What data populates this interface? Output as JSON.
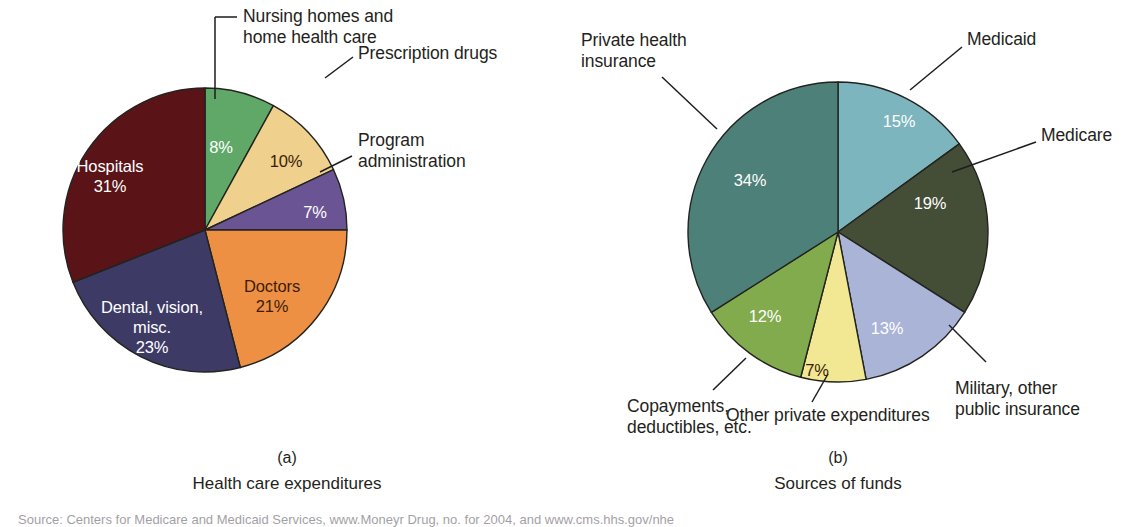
{
  "figure": {
    "background": "#ffffff",
    "source_note": "Source: Centers for Medicare and Medicaid Services, www.Moneyr Drug, no. for 2004, and www.cms.hhs.gov/nhe"
  },
  "chart_data": [
    {
      "type": "pie",
      "id": "health-care-expenditures",
      "panel_letter": "(a)",
      "title": "Health care expenditures",
      "start_angle_deg": 0,
      "direction": "clockwise",
      "center": [
        205,
        230
      ],
      "radius": 142,
      "categories": [
        "Nursing homes and home health care",
        "Prescription drugs",
        "Program administration",
        "Doctors",
        "Dental, vision, misc.",
        "Hospitals"
      ],
      "values": [
        8,
        10,
        7,
        21,
        23,
        31
      ],
      "value_labels": [
        "8%",
        "10%",
        "7%",
        "21%",
        "23%",
        "31%"
      ],
      "colors": [
        "#5FA868",
        "#EFD08C",
        "#6B5494",
        "#ED9043",
        "#3D3B66",
        "#5A1418"
      ],
      "slices": [
        {
          "name": "Nursing homes and home health care",
          "value": 8,
          "value_label": "8%",
          "color": "#5FA868",
          "inside_label": "8%",
          "label_color": "white",
          "label_xy": [
            221,
            147
          ],
          "callout": {
            "text": "Nursing homes and\nhome health care",
            "x": 243,
            "y": 6,
            "align": "left",
            "line": [
              [
                215,
                17
              ],
              [
                237,
                17
              ]
            ],
            "stem": [
              [
                215,
                17
              ],
              [
                215,
                99
              ]
            ]
          }
        },
        {
          "name": "Prescription drugs",
          "value": 10,
          "value_label": "10%",
          "color": "#EFD08C",
          "inside_label": "10%",
          "label_color": "dark",
          "label_xy": [
            286,
            161
          ],
          "callout": {
            "text": "Prescription drugs",
            "x": 358,
            "y": 43,
            "align": "left",
            "line": [
              [
                325,
                78
              ],
              [
                353,
                57
              ]
            ]
          }
        },
        {
          "name": "Program administration",
          "value": 7,
          "value_label": "7%",
          "color": "#6B5494",
          "inside_label": "7%",
          "label_color": "white",
          "label_xy": [
            315,
            212
          ],
          "callout": {
            "text": "Program\nadministration",
            "x": 358,
            "y": 130,
            "align": "left",
            "line": [
              [
                320,
                172
              ],
              [
                352,
                156
              ]
            ]
          }
        },
        {
          "name": "Doctors",
          "value": 21,
          "value_label": "21%",
          "color": "#ED9043",
          "inside_label": "Doctors\n21%",
          "label_color": "dark",
          "label_xy": [
            272,
            296
          ],
          "callout": null
        },
        {
          "name": "Dental, vision, misc.",
          "value": 23,
          "value_label": "23%",
          "color": "#3D3B66",
          "inside_label": "Dental, vision,\nmisc.\n23%",
          "label_color": "white",
          "label_xy": [
            152,
            327
          ],
          "callout": null
        },
        {
          "name": "Hospitals",
          "value": 31,
          "value_label": "31%",
          "color": "#5A1418",
          "inside_label": "Hospitals\n31%",
          "label_color": "white",
          "label_xy": [
            110,
            176
          ],
          "callout": null
        }
      ]
    },
    {
      "type": "pie",
      "id": "sources-of-funds",
      "panel_letter": "(b)",
      "title": "Sources of funds",
      "start_angle_deg": 0,
      "direction": "clockwise",
      "center": [
        838,
        232
      ],
      "radius": 150,
      "categories": [
        "Medicaid",
        "Medicare",
        "Military, other public insurance",
        "Other private expenditures",
        "Copayments, deductibles, etc.",
        "Private health insurance"
      ],
      "values": [
        15,
        19,
        13,
        7,
        12,
        34
      ],
      "value_labels": [
        "15%",
        "19%",
        "13%",
        "7%",
        "12%",
        "34%"
      ],
      "colors": [
        "#7CB5BD",
        "#444D35",
        "#AAB4D6",
        "#F2E893",
        "#82AB4E",
        "#4D8079"
      ],
      "slices": [
        {
          "name": "Medicaid",
          "value": 15,
          "value_label": "15%",
          "color": "#7CB5BD",
          "inside_label": "15%",
          "label_color": "white",
          "label_xy": [
            899,
            121
          ],
          "callout": {
            "text": "Medicaid",
            "x": 967,
            "y": 29,
            "align": "left",
            "line": [
              [
                910,
                90
              ],
              [
                962,
                47
              ]
            ]
          }
        },
        {
          "name": "Medicare",
          "value": 19,
          "value_label": "19%",
          "color": "#444D35",
          "inside_label": "19%",
          "label_color": "white",
          "label_xy": [
            930,
            203
          ],
          "callout": {
            "text": "Medicare",
            "x": 1041,
            "y": 125,
            "align": "left",
            "line": [
              [
                952,
                172
              ],
              [
                1036,
                142
              ]
            ]
          }
        },
        {
          "name": "Military, other public insurance",
          "value": 13,
          "value_label": "13%",
          "color": "#AAB4D6",
          "inside_label": "13%",
          "label_color": "white",
          "label_xy": [
            887,
            328
          ],
          "callout": {
            "text": "Military, other\npublic insurance",
            "x": 955,
            "y": 378,
            "align": "left",
            "line": [
              [
                949,
                325
              ],
              [
                986,
                362
              ]
            ]
          }
        },
        {
          "name": "Other private expenditures",
          "value": 7,
          "value_label": "7%",
          "color": "#F2E893",
          "inside_label": "7%",
          "label_color": "dark",
          "label_xy": [
            817,
            370
          ],
          "callout": {
            "text": "Other private expenditures",
            "x": 726,
            "y": 405,
            "align": "left",
            "line": [
              [
                828,
                374
              ],
              [
                812,
                402
              ]
            ]
          }
        },
        {
          "name": "Copayments, deductibles, etc.",
          "value": 12,
          "value_label": "12%",
          "color": "#82AB4E",
          "inside_label": "12%",
          "label_color": "white",
          "label_xy": [
            765,
            316
          ],
          "callout": {
            "text": "Copayments,\ndeductibles, etc.",
            "x": 627,
            "y": 396,
            "align": "left",
            "line": [
              [
                746,
                358
              ],
              [
                713,
                390
              ]
            ]
          }
        },
        {
          "name": "Private health insurance",
          "value": 34,
          "value_label": "34%",
          "color": "#4D8079",
          "inside_label": "34%",
          "label_color": "white",
          "label_xy": [
            750,
            180
          ],
          "callout": {
            "text": "Private health\ninsurance",
            "x": 581,
            "y": 30,
            "align": "left",
            "line": [
              [
                662,
                77
              ],
              [
                717,
                129
              ]
            ]
          }
        }
      ]
    }
  ],
  "captions": [
    {
      "letter": "(a)",
      "title": "Health care expenditures",
      "x": 287,
      "y": 449
    },
    {
      "letter": "(b)",
      "title": "Sources of funds",
      "x": 838,
      "y": 449
    }
  ]
}
